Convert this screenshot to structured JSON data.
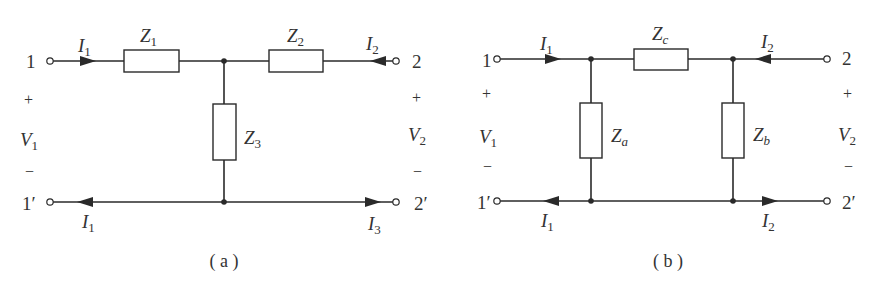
{
  "figure": {
    "colors": {
      "ink": "#2a2a2a",
      "background": "#ffffff"
    },
    "a": {
      "caption": "( a )",
      "topology": "T-network",
      "impedances": [
        {
          "name": "Z",
          "sub": "1",
          "position": "series-left"
        },
        {
          "name": "Z",
          "sub": "2",
          "position": "series-right"
        },
        {
          "name": "Z",
          "sub": "3",
          "position": "shunt"
        }
      ],
      "terminals": {
        "port1_top": "1",
        "port1_bottom": "1′",
        "port2_top": "2",
        "port2_bottom": "2′"
      },
      "voltages": {
        "v1": {
          "name": "V",
          "sub": "1",
          "plus": "+",
          "minus": "−"
        },
        "v2": {
          "name": "V",
          "sub": "2",
          "plus": "+",
          "minus": "−"
        }
      },
      "currents": {
        "top_left": {
          "name": "I",
          "sub": "1",
          "direction": "right"
        },
        "top_right": {
          "name": "I",
          "sub": "2",
          "direction": "left"
        },
        "bottom_left": {
          "name": "I",
          "sub": "1",
          "direction": "left"
        },
        "bottom_right": {
          "name": "I",
          "sub": "3",
          "direction": "right"
        }
      }
    },
    "b": {
      "caption": "( b )",
      "topology": "Pi-network",
      "impedances": [
        {
          "name": "Z",
          "sub": "c",
          "position": "series"
        },
        {
          "name": "Z",
          "sub": "a",
          "position": "shunt-left"
        },
        {
          "name": "Z",
          "sub": "b",
          "position": "shunt-right"
        }
      ],
      "terminals": {
        "port1_top": "1",
        "port1_bottom": "1′",
        "port2_top": "2",
        "port2_bottom": "2′"
      },
      "voltages": {
        "v1": {
          "name": "V",
          "sub": "1",
          "plus": "+",
          "minus": "−"
        },
        "v2": {
          "name": "V",
          "sub": "2",
          "plus": "+",
          "minus": "−"
        }
      },
      "currents": {
        "top_left": {
          "name": "I",
          "sub": "1",
          "direction": "right"
        },
        "top_right": {
          "name": "I",
          "sub": "2",
          "direction": "left"
        },
        "bottom_left": {
          "name": "I",
          "sub": "1",
          "direction": "left"
        },
        "bottom_right": {
          "name": "I",
          "sub": "2",
          "direction": "right"
        }
      }
    }
  }
}
